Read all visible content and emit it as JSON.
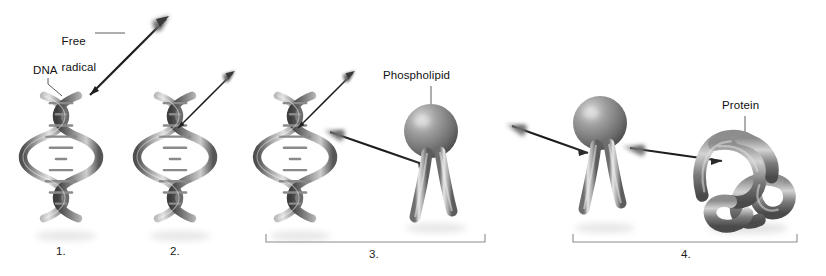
{
  "figure": {
    "background_color": "#ffffff",
    "ink_color": "#111111",
    "molecule_gray_light": "#d8d8d8",
    "molecule_gray_mid": "#9a9a9a",
    "molecule_gray_dark": "#4a4a4a",
    "bracket_color": "#8c8c8c"
  },
  "labels": {
    "free_radical": "Free\nradical",
    "free_radical_line1": "Free",
    "free_radical_line2": "radical",
    "dna": "DNA",
    "phospholipid": "Phospholipid",
    "protein": "Protein"
  },
  "steps": [
    {
      "number": "1.",
      "caption": "1.",
      "subject": "DNA double helix with free radical approaching"
    },
    {
      "number": "2.",
      "caption": "2.",
      "subject": "Free radical strikes DNA double helix"
    },
    {
      "number": "3.",
      "caption": "3.",
      "subject": "Free radical released from DNA travels toward phospholipid"
    },
    {
      "number": "4.",
      "caption": "4.",
      "subject": "Free radical strikes phospholipid and travels toward protein"
    }
  ],
  "icons": {
    "arrow": "free-radical-arrow-icon",
    "dna": "dna-double-helix-icon",
    "phospholipid": "phospholipid-icon",
    "protein": "protein-tangle-icon",
    "bracket": "span-bracket-icon"
  }
}
